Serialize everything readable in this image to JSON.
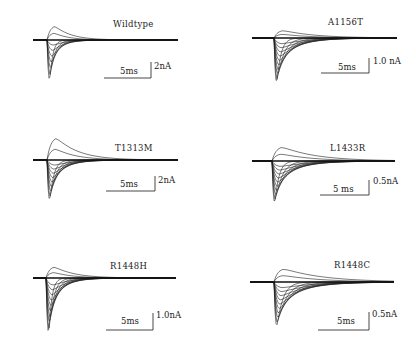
{
  "chart_data": [
    {
      "type": "line",
      "title": "Wildtype",
      "scale_bar": {
        "time": "5ms",
        "current": "2nA"
      },
      "n_traces": 9,
      "description": "Family of sodium current traces; fast inward peak followed by rapid inactivation",
      "geom": {
        "x0": 33,
        "onset": 47,
        "x1": 178,
        "base": 40,
        "peak_max": 86,
        "up_max": 25,
        "tau_min": 3,
        "tau_max": 16,
        "shift": 1.2,
        "title_x": 113,
        "title_y": 27,
        "sb_x0": 104,
        "sb_x1": 151,
        "sb_y": 78,
        "sb_top": 62,
        "t_x": 120,
        "t_y": 74,
        "c_x": 154,
        "c_y": 69
      }
    },
    {
      "type": "line",
      "title": "A1156T",
      "scale_bar": {
        "time": "5ms",
        "current": "1.0 nA"
      },
      "n_traces": 12,
      "description": "Family of sodium current traces with slowed inactivation",
      "geom": {
        "x0": 252,
        "onset": 274,
        "x1": 397,
        "base": 38,
        "peak_max": 89,
        "up_max": 30,
        "tau_min": 4,
        "tau_max": 32,
        "shift": 1.4,
        "title_x": 328,
        "title_y": 25,
        "sb_x0": 321,
        "sb_x1": 369,
        "sb_y": 73,
        "sb_top": 58,
        "t_x": 338,
        "t_y": 70,
        "c_x": 373,
        "c_y": 64
      }
    },
    {
      "type": "line",
      "title": "T1313M",
      "scale_bar": {
        "time": "5ms",
        "current": "2nA"
      },
      "n_traces": 11,
      "description": "Family of sodium current traces with outward tail components",
      "geom": {
        "x0": 33,
        "onset": 47,
        "x1": 178,
        "base": 160,
        "peak_max": 206,
        "up_max": 136,
        "tau_min": 4,
        "tau_max": 22,
        "shift": 1.5,
        "title_x": 115,
        "title_y": 151,
        "sb_x0": 106,
        "sb_x1": 155,
        "sb_y": 191,
        "sb_top": 176,
        "t_x": 120,
        "t_y": 187,
        "c_x": 158,
        "c_y": 183
      }
    },
    {
      "type": "line",
      "title": "L1433R",
      "scale_bar": {
        "time": "5 ms",
        "current": "0.5nA"
      },
      "n_traces": 12,
      "description": "Family of sodium current traces with prolonged inactivation",
      "geom": {
        "x0": 252,
        "onset": 272,
        "x1": 395,
        "base": 161,
        "peak_max": 209,
        "up_max": 146,
        "tau_min": 4,
        "tau_max": 34,
        "shift": 1.6,
        "title_x": 330,
        "title_y": 151,
        "sb_x0": 320,
        "sb_x1": 369,
        "sb_y": 195,
        "sb_top": 180,
        "t_x": 333,
        "t_y": 192,
        "c_x": 373,
        "c_y": 184
      }
    },
    {
      "type": "line",
      "title": "R1448H",
      "scale_bar": {
        "time": "5ms",
        "current": "1.0nA"
      },
      "n_traces": 12,
      "description": "Family of sodium current traces; fast inward peak with moderately slowed decay",
      "geom": {
        "x0": 33,
        "onset": 46,
        "x1": 176,
        "base": 278,
        "peak_max": 341,
        "up_max": 266,
        "tau_min": 3,
        "tau_max": 20,
        "shift": 1.3,
        "title_x": 110,
        "title_y": 269,
        "sb_x0": 106,
        "sb_x1": 153,
        "sb_y": 330,
        "sb_top": 313,
        "t_x": 121,
        "t_y": 324,
        "c_x": 156,
        "c_y": 318
      }
    },
    {
      "type": "line",
      "title": "R1448C",
      "scale_bar": {
        "time": "5ms",
        "current": "0.5nA"
      },
      "n_traces": 12,
      "description": "Family of sodium current traces with markedly slowed inactivation and outward components",
      "geom": {
        "x0": 250,
        "onset": 274,
        "x1": 394,
        "base": 282,
        "peak_max": 332,
        "up_max": 268,
        "tau_min": 6,
        "tau_max": 40,
        "shift": 1.5,
        "title_x": 334,
        "title_y": 268,
        "sb_x0": 318,
        "sb_x1": 369,
        "sb_y": 330,
        "sb_top": 312,
        "t_x": 337,
        "t_y": 324,
        "c_x": 372,
        "c_y": 317
      }
    }
  ]
}
